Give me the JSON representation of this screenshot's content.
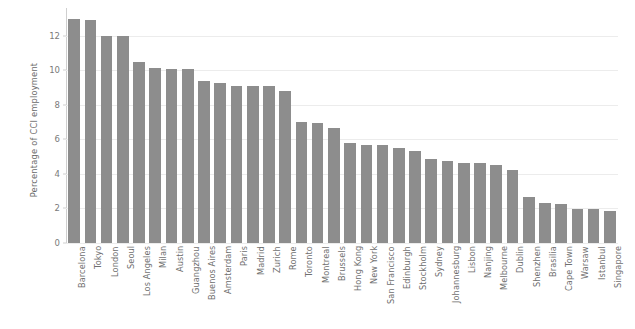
{
  "chart_data": {
    "type": "bar",
    "title": "",
    "subtitle": "",
    "xlabel": "",
    "ylabel": "Percentage of CCI employment",
    "ylim": [
      0,
      13.6
    ],
    "yticks": [
      0,
      2,
      4,
      6,
      8,
      10,
      12
    ],
    "ytick_labels": [
      "0",
      "2",
      "4",
      "6",
      "8",
      "10",
      "12"
    ],
    "grid": "horizontal",
    "legend": "none",
    "bar_color": "#8d8d8d",
    "gridline_color": "#ececec",
    "axis_color": "#cfcfcf",
    "tick_label_color": "#7a7a7a",
    "background_color": "#ffffff",
    "categories": [
      "Barcelona",
      "Tokyo",
      "London",
      "Seoul",
      "Los Angeles",
      "Milan",
      "Austin",
      "Guangzhou",
      "Buenos Aires",
      "Amsterdam",
      "Paris",
      "Madrid",
      "Zurich",
      "Rome",
      "Toronto",
      "Montreal",
      "Brussels",
      "Hong Kong",
      "New York",
      "San Francisco",
      "Edinburgh",
      "Stockholm",
      "Sydney",
      "Johannesburg",
      "Lisbon",
      "Nanjing",
      "Melbourne",
      "Dublin",
      "Shenzhen",
      "Brasilia",
      "Cape Town",
      "Warsaw",
      "Istanbul",
      "Singapore"
    ],
    "values": [
      12.95,
      12.9,
      12.0,
      12.0,
      10.5,
      10.1,
      10.05,
      10.05,
      9.35,
      9.25,
      9.1,
      9.1,
      9.1,
      8.8,
      7.0,
      6.95,
      6.65,
      5.8,
      5.65,
      5.65,
      5.5,
      5.3,
      4.85,
      4.75,
      4.65,
      4.65,
      4.5,
      4.2,
      2.65,
      2.3,
      2.25,
      1.95,
      1.95,
      1.85
    ]
  }
}
